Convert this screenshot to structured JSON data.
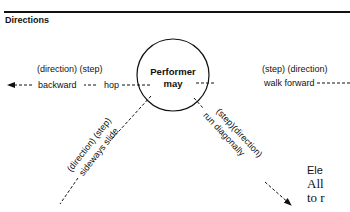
{
  "header": {
    "title": "Directions"
  },
  "diagram": {
    "center_label_line1": "Performer",
    "center_label_line2": "may",
    "branches": [
      {
        "id": "left",
        "top_label": "(direction) (step)",
        "line_label": "backward --- hop",
        "direction": "left"
      },
      {
        "id": "right",
        "top_label": "(step) (direction)",
        "line_label": "walk forward",
        "direction": "right"
      },
      {
        "id": "lower-left",
        "top_label": "(direction) (step)",
        "line_label": "sideways slide",
        "direction": "down-left"
      },
      {
        "id": "lower-right",
        "top_label": "(step)(direction)",
        "line_label": "run diagonally",
        "direction": "down-right"
      }
    ],
    "left_word1": "backward",
    "left_word2": "hop",
    "line_color": "#111111"
  },
  "side_text": {
    "heading": "Ele",
    "line1": "All",
    "line2": "to r"
  }
}
